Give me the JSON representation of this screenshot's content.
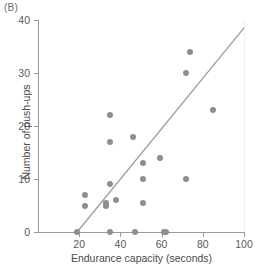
{
  "panel": {
    "label": "(B)"
  },
  "chart_data": {
    "type": "scatter",
    "title": "",
    "xlabel": "Endurance capacity (seconds)",
    "ylabel": "Number of push-ups",
    "xlim": [
      0,
      100
    ],
    "ylim": [
      0,
      40
    ],
    "xticks": [
      20,
      40,
      60,
      80,
      100
    ],
    "yticks": [
      0,
      10,
      20,
      30,
      40
    ],
    "grid": false,
    "legend": null,
    "point_color": "#8e8e8e",
    "line_color": "#9d9d9d",
    "points": [
      {
        "x": 19,
        "y": 0
      },
      {
        "x": 23,
        "y": 7
      },
      {
        "x": 23,
        "y": 5
      },
      {
        "x": 33,
        "y": 5.5
      },
      {
        "x": 33,
        "y": 5
      },
      {
        "x": 35,
        "y": 22
      },
      {
        "x": 35,
        "y": 17
      },
      {
        "x": 35,
        "y": 9
      },
      {
        "x": 35,
        "y": 0
      },
      {
        "x": 38,
        "y": 6
      },
      {
        "x": 46,
        "y": 18
      },
      {
        "x": 47,
        "y": 0
      },
      {
        "x": 51,
        "y": 13
      },
      {
        "x": 51,
        "y": 10
      },
      {
        "x": 51,
        "y": 5.5
      },
      {
        "x": 59,
        "y": 14
      },
      {
        "x": 61,
        "y": 0
      },
      {
        "x": 62,
        "y": 0
      },
      {
        "x": 72,
        "y": 30
      },
      {
        "x": 72,
        "y": 10
      },
      {
        "x": 74,
        "y": 34
      },
      {
        "x": 85,
        "y": 23
      }
    ],
    "fit_line": {
      "x0": 19,
      "y0": 0,
      "x1": 100,
      "y1": 38.5
    }
  }
}
